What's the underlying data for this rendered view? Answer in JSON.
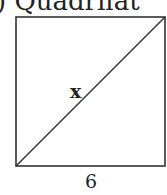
{
  "figure": {
    "title_fragment": ") Quadrilat",
    "shape": "square",
    "diagonal_label": "x",
    "side_label": "6",
    "stroke_color": "#333333"
  }
}
